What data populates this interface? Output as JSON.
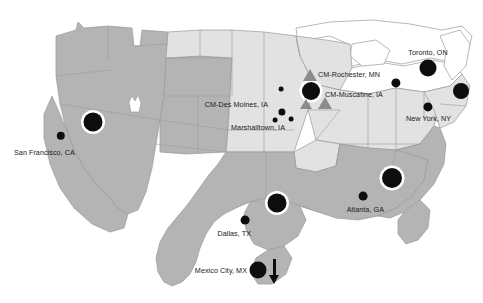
{
  "map": {
    "title": "North America facility location map",
    "background_color": "#ffffff",
    "regions": [
      {
        "name": "west",
        "fill": "#b4b4b4",
        "label": "Western region"
      },
      {
        "name": "plains-mountain",
        "fill": "#e2e2e2",
        "label": "Central / Mountain region"
      },
      {
        "name": "south",
        "fill": "#b4b4b4",
        "label": "Southern region"
      },
      {
        "name": "midwest-northeast",
        "fill": "#e2e2e2",
        "label": "Midwest / Northeast region"
      },
      {
        "name": "canada-outline",
        "fill": "#ffffff",
        "label": "Canada outline"
      }
    ],
    "border_color": "#9a9a9a",
    "marker_color": "#0d0d0d",
    "ring_color": "#ffffff",
    "triangle_color": "#8c8c8c"
  },
  "markers": [
    {
      "id": "nevada-hub",
      "type": "ringed-circle",
      "x": 93,
      "y": 122,
      "r": 9.5,
      "label": ""
    },
    {
      "id": "san-francisco",
      "type": "dot",
      "x": 61,
      "y": 136,
      "r": 4.2,
      "label": "San Francisco, CA"
    },
    {
      "id": "des-moines-a",
      "type": "dot",
      "x": 281,
      "y": 89,
      "r": 2.4,
      "label": ""
    },
    {
      "id": "des-moines-b",
      "type": "dot",
      "x": 282,
      "y": 112,
      "r": 3.6,
      "label": ""
    },
    {
      "id": "marshalltown-a",
      "type": "dot",
      "x": 275,
      "y": 120,
      "r": 2.4,
      "label": ""
    },
    {
      "id": "marshalltown-b",
      "type": "dot",
      "x": 291,
      "y": 119,
      "r": 2.4,
      "label": ""
    },
    {
      "id": "muscatine-hub",
      "type": "ringed-circle",
      "x": 311,
      "y": 91,
      "r": 9.0,
      "label": ""
    },
    {
      "id": "rochester-mn-tri",
      "type": "triangle",
      "x": 310,
      "y": 75,
      "r": 7.0,
      "label": "CM-Rochester, MN"
    },
    {
      "id": "muscatine-tri-a",
      "type": "triangle",
      "x": 306,
      "y": 104,
      "r": 6.0,
      "label": ""
    },
    {
      "id": "muscatine-tri-b",
      "type": "triangle",
      "x": 325,
      "y": 103,
      "r": 7.0,
      "label": "CM-Muscatine, IA"
    },
    {
      "id": "michigan-dot",
      "type": "dot",
      "x": 396,
      "y": 83,
      "r": 4.6,
      "label": ""
    },
    {
      "id": "toronto",
      "type": "dot",
      "x": 428,
      "y": 68,
      "r": 8.5,
      "label": "Toronto, ON"
    },
    {
      "id": "new-england-hub",
      "type": "dot",
      "x": 461,
      "y": 91,
      "r": 8.0,
      "label": ""
    },
    {
      "id": "new-york",
      "type": "dot",
      "x": 428,
      "y": 107,
      "r": 4.6,
      "label": "New York, NY"
    },
    {
      "id": "carolina-hub",
      "type": "ringed-circle",
      "x": 392,
      "y": 178,
      "r": 10.0,
      "label": ""
    },
    {
      "id": "atlanta",
      "type": "dot",
      "x": 363,
      "y": 196,
      "r": 4.4,
      "label": "Atlanta, GA"
    },
    {
      "id": "louisiana-hub",
      "type": "ringed-circle",
      "x": 277,
      "y": 203,
      "r": 9.5,
      "label": ""
    },
    {
      "id": "dallas",
      "type": "dot",
      "x": 245,
      "y": 220,
      "r": 4.4,
      "label": "Dallas, TX"
    },
    {
      "id": "mexico-city",
      "type": "dot",
      "x": 258,
      "y": 270,
      "r": 8.5,
      "label": "Mexico City, MX"
    }
  ],
  "labels": [
    {
      "id": "label-san-francisco",
      "text": "San Francisco, CA",
      "x": 14,
      "y": 152,
      "align": "right"
    },
    {
      "id": "label-des-moines",
      "text": "CM-Des Moines, IA",
      "x": 268,
      "y": 104,
      "align": "left"
    },
    {
      "id": "label-marshalltown",
      "text": "Marshalltown, IA",
      "x": 285,
      "y": 127,
      "align": "left"
    },
    {
      "id": "label-rochester",
      "text": "CM-Rochester, MN",
      "x": 318,
      "y": 74,
      "align": "right"
    },
    {
      "id": "label-muscatine",
      "text": "CM-Muscatine, IA",
      "x": 325,
      "y": 94,
      "align": "right"
    },
    {
      "id": "label-toronto",
      "text": "Toronto, ON",
      "x": 428,
      "y": 52,
      "align": "center"
    },
    {
      "id": "label-new-york",
      "text": "New York, NY",
      "x": 451,
      "y": 118,
      "align": "left"
    },
    {
      "id": "label-atlanta",
      "text": "Atlanta, GA",
      "x": 384,
      "y": 209,
      "align": "left"
    },
    {
      "id": "label-dallas",
      "text": "Dallas, TX",
      "x": 251,
      "y": 233,
      "align": "left"
    },
    {
      "id": "label-mexico-city",
      "text": "Mexico City, MX",
      "x": 247,
      "y": 270,
      "align": "left"
    }
  ],
  "arrow": {
    "id": "mexico-direction-arrow",
    "x": 274,
    "y": 272,
    "direction": "down"
  }
}
